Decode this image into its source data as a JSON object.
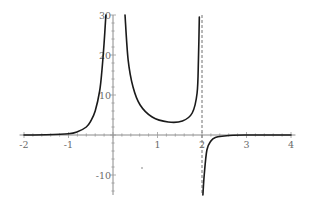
{
  "chart_data": {
    "type": "line",
    "title": "",
    "xlabel": "",
    "ylabel": "",
    "xlim": [
      -2.1,
      4.1
    ],
    "ylim": [
      -15,
      30
    ],
    "grid": false,
    "legend": null,
    "x_ticks": [
      -2,
      -1,
      1,
      2,
      3,
      4
    ],
    "x_tick_labels": [
      "-2",
      "-1",
      "1",
      "2",
      "3",
      "4"
    ],
    "y_ticks": [
      -10,
      10,
      20,
      30
    ],
    "y_tick_labels": [
      "-10",
      "10",
      "20",
      "30"
    ],
    "x_minor_step": 0.2,
    "y_minor_step": 2,
    "vertical_asymptotes": [
      {
        "x": 2,
        "style": "dashed"
      }
    ],
    "series": [
      {
        "name": "left-branch",
        "x": [
          -2.0,
          -1.5,
          -1.0,
          -0.8,
          -0.6,
          -0.5,
          -0.4,
          -0.3,
          -0.25,
          -0.2,
          -0.16
        ],
        "y": [
          0.0,
          0.05,
          0.3,
          0.8,
          2.0,
          3.5,
          6.0,
          11.0,
          16.0,
          23.0,
          30.0
        ]
      },
      {
        "name": "middle-branch",
        "x": [
          0.27,
          0.34,
          0.45,
          0.61,
          0.88,
          1.24,
          1.56,
          1.78,
          1.89,
          1.92,
          1.94
        ],
        "y": [
          30.0,
          18.8,
          12.0,
          7.5,
          4.5,
          3.25,
          3.5,
          5.5,
          10.5,
          18.8,
          29.5
        ]
      },
      {
        "name": "right-branch",
        "x": [
          2.02,
          2.05,
          2.11,
          2.2,
          2.3,
          2.5,
          2.7,
          3.0,
          3.5,
          4.0
        ],
        "y": [
          -15.0,
          -10.0,
          -3.75,
          -1.5,
          -0.6,
          -0.25,
          -0.05,
          0.0,
          0.0,
          0.0
        ]
      }
    ]
  },
  "axes": {
    "origin_px": {
      "x": 113,
      "y": 135
    },
    "px_per_unit_x": 44.5,
    "px_per_unit_y": 4
  },
  "colors": {
    "curve": "#1a1a1a",
    "axis": "#8a8a8a",
    "labels": "#6a6a6a",
    "asymptote": "#707070",
    "background": "#ffffff"
  }
}
